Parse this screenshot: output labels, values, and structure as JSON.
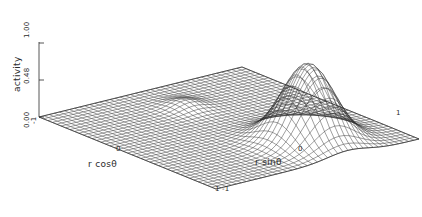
{
  "figure": {
    "kind": "3d-surface-wireframe",
    "background_color": "#ffffff",
    "line_color": "#2b2b2b"
  },
  "axes": {
    "vertical": {
      "label": "activity",
      "ticks": [
        "1.00",
        "0.48",
        "0.00"
      ]
    },
    "left_horizontal": {
      "label": "r cosθ",
      "ticks": [
        "-1",
        "0",
        "1"
      ],
      "visible_origin_tick": "0",
      "visible_min_tick": "-1",
      "visible_max_tick": "1"
    },
    "right_horizontal": {
      "label": "r sinθ",
      "ticks": [
        "-1",
        "0",
        "1"
      ],
      "visible_origin_tick": "0",
      "visible_min_tick": "-1",
      "visible_max_tick": "1"
    },
    "front_corner_ticks": "1 -1",
    "right_corner_tick": "1"
  },
  "chart_data": {
    "type": "surface",
    "title": "",
    "xlabel": "r cosθ",
    "ylabel": "r sinθ",
    "zlabel": "activity",
    "xlim": [
      -1,
      1
    ],
    "ylim": [
      -1,
      1
    ],
    "zlim": [
      0.0,
      1.0
    ],
    "ztick_values": [
      0.0,
      0.48,
      1.0
    ],
    "ztick_labels": [
      "0.00",
      "0.48",
      "1.00"
    ],
    "grid": true,
    "legend": "none",
    "mesh": {
      "nx": 41,
      "ny": 41,
      "wireframe": true,
      "filled": false
    },
    "peaks": [
      {
        "name": "main-peak",
        "x": 0.55,
        "y": 0.3,
        "amplitude": 1.0,
        "sigma": 0.2
      },
      {
        "name": "secondary-ridge",
        "x": -0.55,
        "y": 0.05,
        "amplitude": 0.09,
        "sigma": 0.12
      }
    ],
    "baseline": 0.0,
    "surface_function": "z = exp(-((x-0.55)^2+(y-0.30)^2)/(2*0.20^2)) + 0.09*exp(-((x+0.55)^2+(y-0.05)^2)/(2*0.12^2))"
  }
}
